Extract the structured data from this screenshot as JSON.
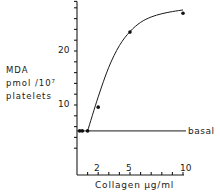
{
  "chart_data": {
    "type": "line",
    "title": "",
    "xlabel": "Collagen µg/ml",
    "ylabel": [
      "MDA",
      "pmol /10⁷",
      "platelets"
    ],
    "x_tick_labels": [
      "2",
      "5",
      "10"
    ],
    "x_ticks": [
      1,
      2,
      3,
      4,
      5,
      6,
      7,
      8,
      9,
      10
    ],
    "y_tick_labels": [
      "10",
      "20"
    ],
    "y_ticks": [
      2,
      4,
      6,
      8,
      10,
      12,
      14,
      16,
      18,
      20,
      22,
      24,
      26,
      28
    ],
    "xlim": [
      0,
      10.5
    ],
    "ylim": [
      0,
      29
    ],
    "grid": false,
    "series": [
      {
        "name": "MDA production",
        "points": [
          {
            "x": 0.25,
            "y": 5.2
          },
          {
            "x": 0.5,
            "y": 5.2
          },
          {
            "x": 1.0,
            "y": 5.2
          },
          {
            "x": 2.0,
            "y": 9.6
          },
          {
            "x": 5.0,
            "y": 23.5
          },
          {
            "x": 10.0,
            "y": 27.0
          }
        ],
        "fitted_curve": [
          {
            "x": 1.0,
            "y": 5.2
          },
          {
            "x": 2.0,
            "y": 11.5
          },
          {
            "x": 3.0,
            "y": 17.0
          },
          {
            "x": 4.0,
            "y": 21.0
          },
          {
            "x": 5.0,
            "y": 23.6
          },
          {
            "x": 6.0,
            "y": 25.3
          },
          {
            "x": 7.0,
            "y": 26.3
          },
          {
            "x": 8.0,
            "y": 26.9
          },
          {
            "x": 9.0,
            "y": 27.3
          },
          {
            "x": 10.0,
            "y": 27.6
          }
        ]
      }
    ],
    "annotations": [
      {
        "text": "basal",
        "type": "hline",
        "y": 5.2
      }
    ]
  }
}
